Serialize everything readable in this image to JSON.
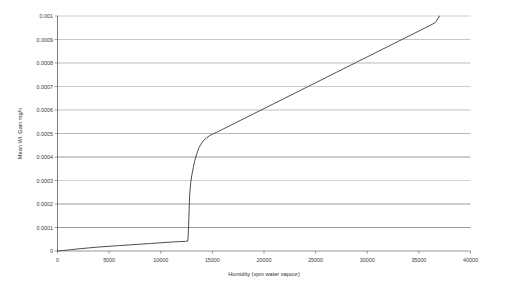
{
  "chart_data": {
    "type": "line",
    "title": "",
    "xlabel": "Humidity (vpm water vapour)",
    "ylabel": "Mean Wt. Gain mg/h",
    "xlim": [
      0,
      40000
    ],
    "ylim": [
      0,
      0.001
    ],
    "grid": true,
    "legend": "none",
    "xticks": [
      0,
      5000,
      10000,
      15000,
      20000,
      25000,
      30000,
      35000,
      40000
    ],
    "xtick_labels": [
      "0",
      "5000",
      "10000",
      "15000",
      "20000",
      "25000",
      "30000",
      "35000",
      "40000"
    ],
    "yticks": [
      0,
      0.0001,
      0.0002,
      0.0003,
      0.0004,
      0.0005,
      0.0006,
      0.0007,
      0.0008,
      0.0009,
      0.001
    ],
    "ytick_labels": [
      "0",
      "0.0001",
      "0.0002",
      "0.0003",
      "0.0004",
      "0.0005",
      "0.0006",
      "0.0007",
      "0.0008",
      "0.0009",
      "0.001"
    ],
    "series": [
      {
        "name": "Mean Wt. Gain",
        "color": "#4d4d4d",
        "x": [
          0,
          500,
          1200,
          2000,
          3000,
          4000,
          5000,
          6000,
          7000,
          8000,
          9000,
          10000,
          11000,
          11800,
          12400,
          12600,
          12650,
          12700,
          12750,
          12800,
          12900,
          13000,
          13150,
          13300,
          13500,
          13700,
          13900,
          14100,
          14400,
          14700,
          15000,
          15400,
          16000,
          17000,
          18000,
          19000,
          20000,
          21000,
          22000,
          23000,
          24000,
          25000,
          26000,
          27000,
          28000,
          29000,
          30000,
          31000,
          32000,
          33000,
          34000,
          35000,
          36000,
          36600,
          37000
        ],
        "y": [
          0.0,
          2e-06,
          5e-06,
          9e-06,
          1.3e-05,
          1.7e-05,
          2e-05,
          2.3e-05,
          2.6e-05,
          2.9e-05,
          3.2e-05,
          3.5e-05,
          3.8e-05,
          4e-05,
          4.1e-05,
          4.2e-05,
          6e-05,
          0.00011,
          0.000175,
          0.00024,
          0.00029,
          0.00032,
          0.000355,
          0.000385,
          0.000415,
          0.00044,
          0.000455,
          0.000468,
          0.00048,
          0.00049,
          0.000497,
          0.000505,
          0.000518,
          0.00054,
          0.000562,
          0.000584,
          0.000606,
          0.000628,
          0.00065,
          0.000672,
          0.000694,
          0.000716,
          0.000738,
          0.00076,
          0.000782,
          0.000804,
          0.000826,
          0.000848,
          0.00087,
          0.000892,
          0.000914,
          0.000936,
          0.000958,
          0.000972,
          0.001
        ]
      }
    ],
    "gridline_styles": [
      {
        "value": 0.001,
        "color": "#b9b9b9",
        "width": 0.7
      },
      {
        "value": 0.0009,
        "color": "#b0b0b0",
        "width": 0.7
      },
      {
        "value": 0.0008,
        "color": "#9d9d9d",
        "width": 0.8
      },
      {
        "value": 0.0007,
        "color": "#b6b6b6",
        "width": 0.7
      },
      {
        "value": 0.0006,
        "color": "#a3a3a3",
        "width": 0.8
      },
      {
        "value": 0.0005,
        "color": "#9a9a9a",
        "width": 0.8
      },
      {
        "value": 0.0004,
        "color": "#6f6f6f",
        "width": 1.0
      },
      {
        "value": 0.0003,
        "color": "#bcbcbc",
        "width": 0.7
      },
      {
        "value": 0.0002,
        "color": "#6f6f6f",
        "width": 1.0
      },
      {
        "value": 0.0001,
        "color": "#707070",
        "width": 1.0
      },
      {
        "value": 0.0,
        "color": "#6b6b6b",
        "width": 0.9
      }
    ]
  },
  "axes": {
    "x_title": "Humidity (vpm water vapour)",
    "y_title": "Mean Wt. Gain mg/h"
  },
  "colors": {
    "series": "#4d4d4d",
    "axis": "#6b6b6b",
    "grid_light": "#b9b9b9",
    "grid_dark": "#6f6f6f",
    "text": "#3a3a3a",
    "background": "#ffffff"
  }
}
